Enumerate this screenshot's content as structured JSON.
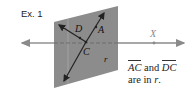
{
  "example_label": "Ex. 1",
  "plane": {
    "label": "r",
    "fill": "#8c8c8c"
  },
  "points": {
    "D": "D",
    "A": "A",
    "C": "C",
    "X": "X"
  },
  "caption": {
    "line1_seg1": "AC",
    "line1_and": " and ",
    "line1_seg2": "DC",
    "line2": "are in ",
    "line2_var": "r",
    "line2_end": "."
  },
  "colors": {
    "line": "#8a8a8a",
    "arrow_dark": "#222222",
    "plane": "#8c8c8c",
    "text": "#222222"
  }
}
